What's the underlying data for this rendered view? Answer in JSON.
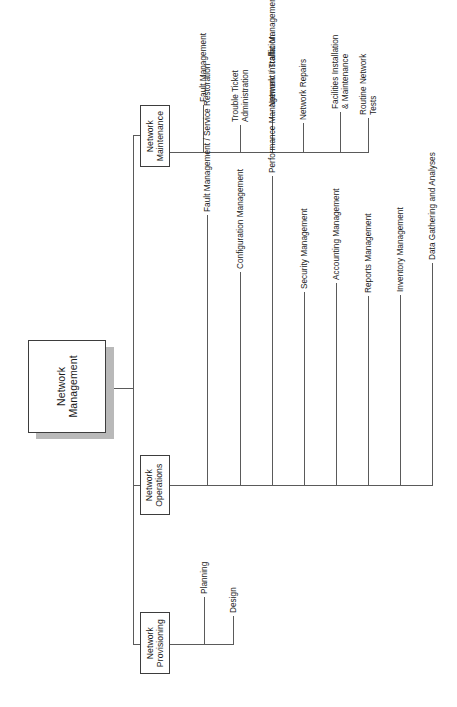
{
  "diagram": {
    "type": "hierarchy-tree",
    "orientation": "left-to-right, rotated text (vertical)",
    "colors": {
      "box_border": "#3d3d3d",
      "box_fill": "#ffffff",
      "connector_line": "#5a5a5a",
      "shadow": "#b9b9b9",
      "text": "#1a1a1a",
      "background": "#ffffff"
    }
  },
  "root": {
    "label": "Network\nManagement",
    "line1": "Network",
    "line2": "Management",
    "has_shadow": true
  },
  "branches": [
    {
      "id": "network-maintenance",
      "label_line1": "Network",
      "label_line2": "Maintenance",
      "children": [
        {
          "label": "Fault Management",
          "lines": [
            "Fault Management"
          ]
        },
        {
          "label": "Trouble Ticket Administration",
          "lines": [
            "Trouble Ticket",
            "Administration"
          ]
        },
        {
          "label": "Network Installation",
          "lines": [
            "Network Installation"
          ]
        },
        {
          "label": "Network Repairs",
          "lines": [
            "Network Repairs"
          ]
        },
        {
          "label": "Facilities Installation & Maintenance",
          "lines": [
            "Facilities Installation",
            "& Maintenance"
          ]
        },
        {
          "label": "Routine Network Tests",
          "lines": [
            "Routine Network",
            "Tests"
          ]
        }
      ]
    },
    {
      "id": "network-operations",
      "label_line1": "Network",
      "label_line2": "Operations",
      "children": [
        {
          "label": "Fault Management / Service Restoration",
          "lines": [
            "Fault Management / Service Restoration"
          ]
        },
        {
          "label": "Configuration Management",
          "lines": [
            "Configuration Management"
          ]
        },
        {
          "label": "Performance Management / Traffic Management",
          "lines": [
            "Performance Management / Traffic Management"
          ]
        },
        {
          "label": "Security Management",
          "lines": [
            "Security Management"
          ]
        },
        {
          "label": "Accounting Management",
          "lines": [
            "Accounting Management"
          ]
        },
        {
          "label": "Reports Management",
          "lines": [
            "Reports Management"
          ]
        },
        {
          "label": "Inventory Management",
          "lines": [
            "Inventory Management"
          ]
        },
        {
          "label": "Data Gathering and Analyses",
          "lines": [
            "Data Gathering and Analyses"
          ]
        }
      ]
    },
    {
      "id": "network-provisioning",
      "label_line1": "Network",
      "label_line2": "Provisioning",
      "children": [
        {
          "label": "Planning",
          "lines": [
            "Planning"
          ]
        },
        {
          "label": "Design",
          "lines": [
            "Design"
          ]
        }
      ]
    }
  ]
}
